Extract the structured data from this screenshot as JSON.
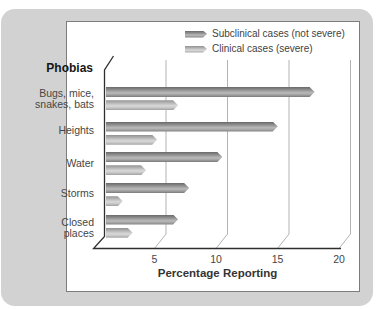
{
  "figure": {
    "y_axis_heading": "Phobias",
    "x_axis_title": "Percentage Reporting"
  },
  "legend": {
    "items": [
      {
        "label": "Subclinical cases (not severe)",
        "swatch_color": "#8f8f8f"
      },
      {
        "label": "Clinical cases (severe)",
        "swatch_color": "#bcbcbc"
      }
    ]
  },
  "chart_data": {
    "type": "bar",
    "orientation": "horizontal",
    "style": "3d-depth-grayscale",
    "title": "",
    "ylabel": "Phobias",
    "xlabel": "Percentage Reporting",
    "categories": [
      "Bugs, mice, snakes, bats",
      "Heights",
      "Water",
      "Storms",
      "Closed places"
    ],
    "categories_display": [
      [
        "Bugs, mice,",
        "snakes, bats"
      ],
      [
        "Heights"
      ],
      [
        "Water"
      ],
      [
        "Storms"
      ],
      [
        "Closed",
        "places"
      ]
    ],
    "series": [
      {
        "name": "Subclinical cases (not severe)",
        "color": "#8f8f8f",
        "values": [
          17,
          14,
          9.5,
          6.8,
          5.9
        ]
      },
      {
        "name": "Clinical cases (severe)",
        "color": "#bcbcbc",
        "values": [
          5.9,
          4.2,
          3.3,
          1.4,
          2.2
        ]
      }
    ],
    "xticks": [
      5,
      10,
      15,
      20
    ],
    "xlim": [
      0,
      21
    ],
    "grid": true,
    "legend_position": "top-right"
  },
  "colors": {
    "card_background": "#d2d2d2",
    "panel_background": "#ffffff",
    "panel_border": "#7d7d7d",
    "axis_line": "#2e2e2e",
    "gridline": "#b3b3b3",
    "text": "#464646"
  }
}
